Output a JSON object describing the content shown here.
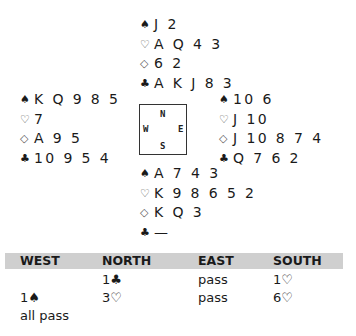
{
  "hands": {
    "north": {
      "spades": "J 2",
      "hearts": "A Q 4 3",
      "diamonds": "6 2",
      "clubs": "A K J 8 3"
    },
    "west": {
      "spades": "K Q 9 8 5",
      "hearts": "7",
      "diamonds": "A 9 5",
      "clubs": "10 9 5 4"
    },
    "east": {
      "spades": "10 6",
      "hearts": "J 10",
      "diamonds": "J 10 8 7 4",
      "clubs": "Q 7 6 2"
    },
    "south": {
      "spades": "A 7 4 3",
      "hearts": "K 9 8 6 5 2",
      "diamonds": "K Q 3",
      "clubs": "—"
    }
  },
  "suits": {
    "spades": "♠",
    "hearts": "♡",
    "diamonds": "◇",
    "clubs": "♣"
  },
  "compass": {
    "n": "N",
    "w": "W",
    "e": "E",
    "s": "S"
  },
  "auction": {
    "headers": [
      "WEST",
      "NORTH",
      "EAST",
      "SOUTH"
    ],
    "rows": [
      {
        "west": "",
        "north": "1♣",
        "east": "pass",
        "south": "1♡"
      },
      {
        "west": "1♠",
        "north": "3♡",
        "east": "pass",
        "south": "6♡"
      },
      {
        "west": "all pass",
        "north": "",
        "east": "",
        "south": ""
      }
    ]
  },
  "colors": {
    "header_bg": "#cfcfcf",
    "text": "#1a1a1a"
  }
}
